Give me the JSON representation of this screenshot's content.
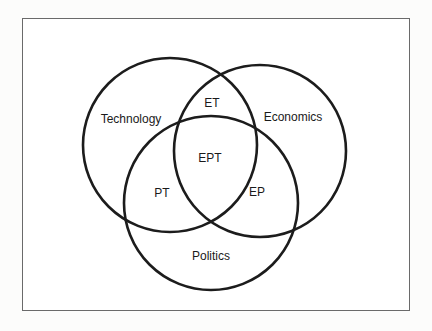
{
  "diagram": {
    "type": "venn",
    "sets": [
      {
        "id": "technology",
        "label": "Technology",
        "cx": 170,
        "cy": 145,
        "r": 87
      },
      {
        "id": "economics",
        "label": "Economics",
        "cx": 260,
        "cy": 151,
        "r": 86
      },
      {
        "id": "politics",
        "label": "Politics",
        "cx": 211,
        "cy": 203,
        "r": 87
      }
    ],
    "intersections": [
      {
        "id": "et",
        "label": "ET",
        "sets": [
          "economics",
          "technology"
        ]
      },
      {
        "id": "ept",
        "label": "EPT",
        "sets": [
          "economics",
          "politics",
          "technology"
        ]
      },
      {
        "id": "pt",
        "label": "PT",
        "sets": [
          "politics",
          "technology"
        ]
      },
      {
        "id": "ep",
        "label": "EP",
        "sets": [
          "economics",
          "politics"
        ]
      }
    ]
  },
  "labels": {
    "technology": "Technology",
    "economics": "Economics",
    "politics": "Politics",
    "et": "ET",
    "ept": "EPT",
    "pt": "PT",
    "ep": "EP"
  }
}
